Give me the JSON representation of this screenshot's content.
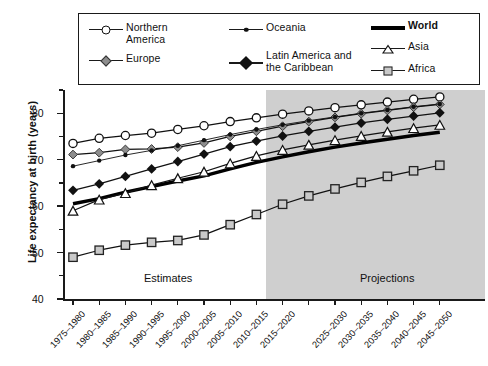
{
  "chart_data": {
    "type": "line",
    "title": "",
    "xlabel": "",
    "ylabel": "Life expectancy at birth (years)",
    "ylim": [
      40,
      85
    ],
    "yticks": [
      40,
      50,
      60,
      70,
      80
    ],
    "grid": false,
    "legend_position": "top",
    "categories": [
      "1975–1980",
      "1980–1985",
      "1985–1990",
      "1990–1995",
      "1995–2000",
      "2000–2005",
      "2005–2010",
      "2010–2015",
      "2015–2020",
      "2020–2025",
      "2025–2030",
      "2030–2035",
      "2035–2040",
      "2040–2045",
      "2045–2050"
    ],
    "tick_labels": [
      "1975–1980",
      "1980–1985",
      "1985–1990",
      "1990–1995",
      "1995–2000",
      "2000–2005",
      "2005–2010",
      "2010–2015",
      "2015–2020",
      "",
      "2025–2030",
      "2030–2035",
      "2035–2040",
      "2040–2045",
      "2045–2050"
    ],
    "annotations": [
      {
        "text": "Estimates",
        "region": "1975–2015"
      },
      {
        "text": "Projections",
        "region": "2015–2050"
      }
    ],
    "projection_start_index": 8,
    "series": [
      {
        "name": "Northern America",
        "marker": "open-circle",
        "color": "#ffffff",
        "values": [
          73.5,
          74.6,
          75.2,
          75.7,
          76.5,
          77.3,
          78.2,
          79.0,
          79.8,
          80.5,
          81.2,
          81.8,
          82.4,
          83.0,
          83.5
        ]
      },
      {
        "name": "Europe",
        "marker": "grey-diamond",
        "color": "#8d8d8d",
        "values": [
          71.1,
          71.5,
          72.2,
          72.3,
          72.7,
          73.6,
          75.0,
          76.1,
          77.2,
          78.2,
          79.1,
          79.9,
          80.6,
          81.3,
          81.9
        ]
      },
      {
        "name": "Oceania",
        "marker": "small-dot",
        "color": "#111111",
        "values": [
          68.6,
          69.8,
          71.0,
          72.0,
          73.0,
          74.2,
          75.4,
          76.5,
          77.5,
          78.4,
          79.2,
          80.0,
          80.7,
          81.4,
          82.0
        ]
      },
      {
        "name": "Latin America and the Caribbean",
        "marker": "black-diamond",
        "color": "#111111",
        "values": [
          63.4,
          64.8,
          66.4,
          68.0,
          69.6,
          71.2,
          72.8,
          74.0,
          75.1,
          76.1,
          77.0,
          77.9,
          78.7,
          79.4,
          80.1
        ]
      },
      {
        "name": "World",
        "marker": "none",
        "color": "#000000",
        "values": [
          60.5,
          61.6,
          63.0,
          64.2,
          65.4,
          66.5,
          68.0,
          69.4,
          70.6,
          71.7,
          72.7,
          73.6,
          74.4,
          75.2,
          75.9
        ]
      },
      {
        "name": "Asia",
        "marker": "open-triangle",
        "color": "#ffffff",
        "values": [
          59.0,
          61.4,
          62.8,
          64.5,
          66.0,
          67.4,
          69.2,
          70.8,
          72.1,
          73.2,
          74.2,
          75.1,
          76.0,
          76.8,
          77.5
        ]
      },
      {
        "name": "Africa",
        "marker": "grey-square",
        "color": "#c9c9c9",
        "values": [
          49.0,
          50.5,
          51.6,
          52.2,
          52.6,
          53.8,
          56.0,
          58.2,
          60.4,
          62.2,
          63.7,
          65.1,
          66.4,
          67.6,
          68.8
        ]
      }
    ]
  },
  "legend": {
    "entries": [
      {
        "label": "Northern\nAmerica",
        "glyph": "open-circle-line",
        "icon_name": "legend-marker-open-circle"
      },
      {
        "label": "Europe",
        "glyph": "grey-diamond-line",
        "icon_name": "legend-marker-grey-diamond"
      },
      {
        "label": "Oceania",
        "glyph": "small-dot-line",
        "icon_name": "legend-marker-small-dot"
      },
      {
        "label": "Latin America and\nthe Caribbean",
        "glyph": "black-diamond-line",
        "icon_name": "legend-marker-black-diamond"
      },
      {
        "label": "World",
        "glyph": "thick-line",
        "icon_name": "legend-marker-thick-line"
      },
      {
        "label": "Asia",
        "glyph": "open-triangle-line",
        "icon_name": "legend-marker-open-triangle"
      },
      {
        "label": "Africa",
        "glyph": "grey-square-line",
        "icon_name": "legend-marker-grey-square"
      }
    ]
  },
  "colors": {
    "projection_shade": "#cfcfcf",
    "axis": "#1a1a1a",
    "grey_marker": "#8d8d8d",
    "square_marker": "#c9c9c9",
    "line": "#111111"
  }
}
